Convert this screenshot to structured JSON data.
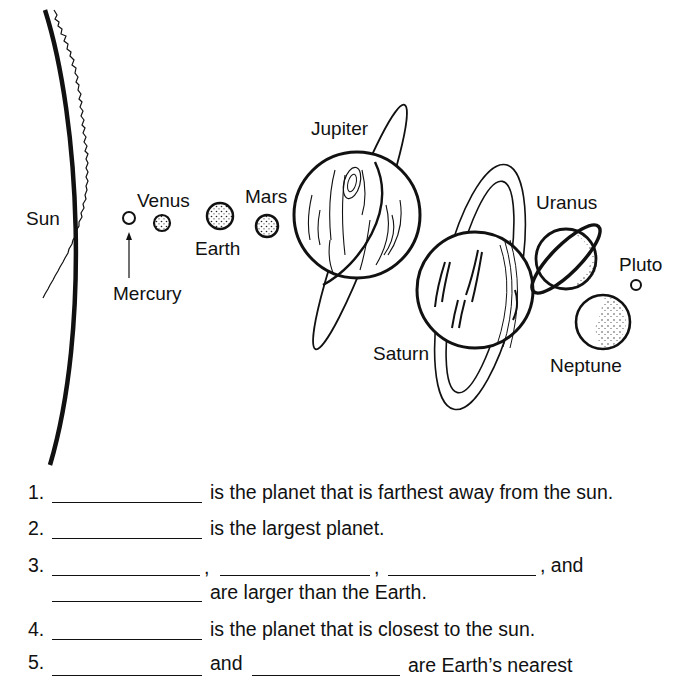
{
  "diagram": {
    "labels": {
      "sun": "Sun",
      "mercury": "Mercury",
      "venus": "Venus",
      "earth": "Earth",
      "mars": "Mars",
      "jupiter": "Jupiter",
      "saturn": "Saturn",
      "uranus": "Uranus",
      "neptune": "Neptune",
      "pluto": "Pluto"
    }
  },
  "questions": [
    {
      "number": "1.",
      "text": "is the planet that is farthest away from the sun."
    },
    {
      "number": "2.",
      "text": "is the largest planet."
    },
    {
      "number": "3.",
      "sep1": ",",
      "sep2": ",",
      "sep3": ", and",
      "text": "are larger than the Earth."
    },
    {
      "number": "4.",
      "text": "is the planet that is closest to the sun."
    },
    {
      "number": "5.",
      "mid": "and",
      "text": "are Earth’s nearest"
    }
  ]
}
